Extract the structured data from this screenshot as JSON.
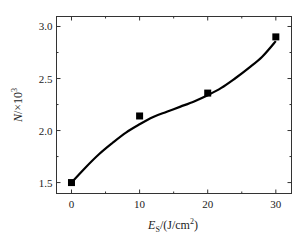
{
  "chart_data": {
    "type": "scatter",
    "title": "",
    "xlabel": "E_S/(J/cm²)",
    "xlabel_parts": {
      "var": "E",
      "sub": "S",
      "unit": "/(J/cm",
      "sup": "2",
      "close": ")"
    },
    "ylabel": "N/×10³",
    "ylabel_parts": {
      "var": "N",
      "mid": "/×10",
      "sup": "3"
    },
    "xlim": [
      -2.2,
      32.3
    ],
    "ylim": [
      1.395,
      3.096
    ],
    "xticks": [
      0,
      10,
      20,
      30
    ],
    "xtick_labels": [
      "0",
      "10",
      "20",
      "30"
    ],
    "yticks": [
      1.5,
      2.0,
      2.5,
      3.0
    ],
    "ytick_labels": [
      "1.5",
      "2.0",
      "2.5",
      "3.0"
    ],
    "grid": false,
    "legend": null,
    "series": [
      {
        "name": "measured",
        "marker": "square",
        "x": [
          0,
          10,
          20,
          30
        ],
        "y": [
          1.5,
          2.14,
          2.36,
          2.9
        ]
      },
      {
        "name": "fit",
        "style": "line",
        "x": [
          0,
          2,
          4,
          6,
          8,
          10,
          12,
          14,
          16,
          18,
          20,
          22,
          24,
          26,
          28,
          30
        ],
        "y": [
          1.5,
          1.64,
          1.77,
          1.88,
          1.98,
          2.06,
          2.13,
          2.18,
          2.23,
          2.28,
          2.34,
          2.41,
          2.5,
          2.6,
          2.71,
          2.86
        ]
      }
    ]
  }
}
